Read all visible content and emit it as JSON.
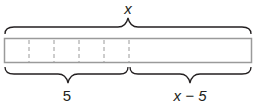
{
  "diagram": {
    "type": "tape-diagram",
    "top_label": "x",
    "bottom_left_label": "5",
    "bottom_right_label": "x − 5",
    "units_left": 5,
    "colors": {
      "bar_stroke": "#9a9a9a",
      "brace": "#231f20",
      "dash": "#9a9a9a",
      "text": "#231f20"
    }
  }
}
